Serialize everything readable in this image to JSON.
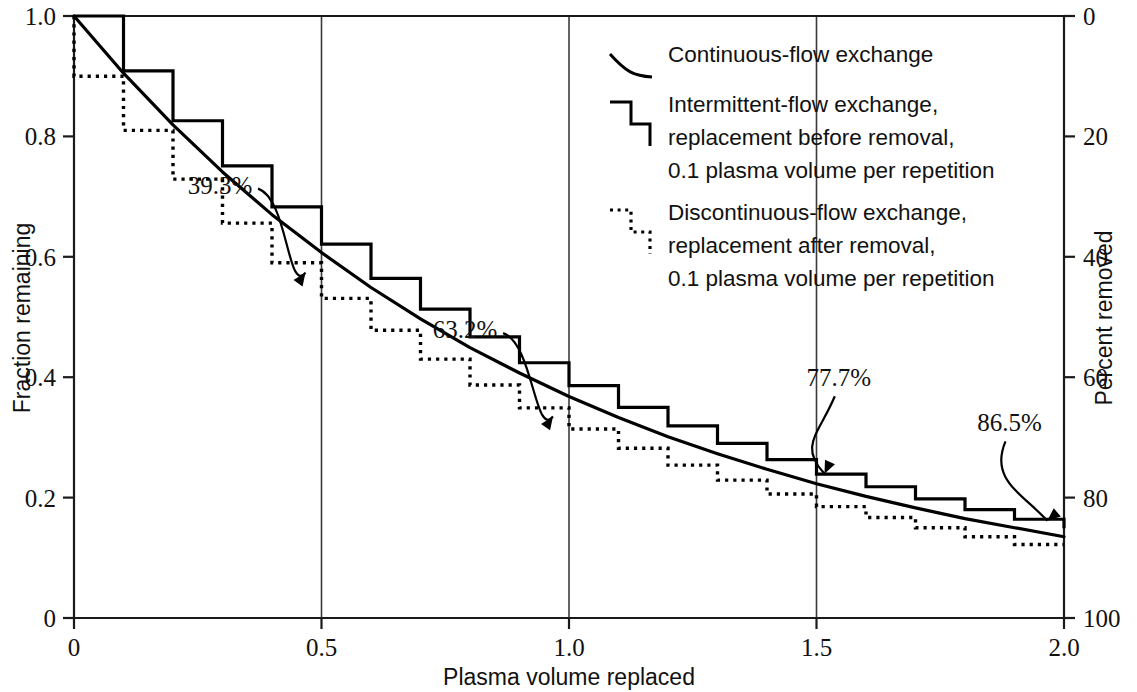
{
  "chart_data": {
    "type": "line",
    "title": "",
    "xlabel": "Plasma volume replaced",
    "ylabel": "Fraction remaining",
    "y2label": "Percent removed",
    "xlim": [
      0,
      2.0
    ],
    "ylim": [
      0,
      1.0
    ],
    "y2lim": [
      100,
      0
    ],
    "grid": "vertical-only",
    "legend_position": "top-right",
    "x_ticks": [
      "0",
      "0.5",
      "1.0",
      "1.5",
      "2.0"
    ],
    "x_tick_values": [
      0,
      0.5,
      1.0,
      1.5,
      2.0
    ],
    "y_ticks": [
      "0",
      "0.2",
      "0.4",
      "0.6",
      "0.8",
      "1.0"
    ],
    "y_tick_values": [
      0,
      0.2,
      0.4,
      0.6,
      0.8,
      1.0
    ],
    "y2_ticks": [
      "0",
      "20",
      "40",
      "60",
      "80",
      "100"
    ],
    "y2_tick_values": [
      0,
      20,
      40,
      60,
      80,
      100
    ],
    "series": [
      {
        "name": "Continuous-flow exchange",
        "style": "solid-smooth",
        "formula": "y = exp(-x)",
        "x": [
          0,
          0.1,
          0.2,
          0.3,
          0.4,
          0.5,
          0.6,
          0.7,
          0.8,
          0.9,
          1.0,
          1.1,
          1.2,
          1.3,
          1.4,
          1.5,
          1.6,
          1.7,
          1.8,
          1.9,
          2.0
        ],
        "values": [
          1.0,
          0.905,
          0.819,
          0.741,
          0.67,
          0.607,
          0.549,
          0.497,
          0.449,
          0.407,
          0.368,
          0.333,
          0.301,
          0.273,
          0.247,
          0.223,
          0.202,
          0.183,
          0.165,
          0.15,
          0.135
        ]
      },
      {
        "name": "Intermittent-flow exchange, replacement before removal, 0.1 plasma volume per repetition",
        "style": "solid-step",
        "formula": "y = (1/1.1)^n",
        "x": [
          0,
          0.1,
          0.2,
          0.3,
          0.4,
          0.5,
          0.6,
          0.7,
          0.8,
          0.9,
          1.0,
          1.1,
          1.2,
          1.3,
          1.4,
          1.5,
          1.6,
          1.7,
          1.8,
          1.9,
          2.0
        ],
        "values": [
          1.0,
          0.909,
          0.826,
          0.751,
          0.683,
          0.621,
          0.564,
          0.513,
          0.467,
          0.424,
          0.386,
          0.35,
          0.319,
          0.29,
          0.263,
          0.239,
          0.218,
          0.198,
          0.18,
          0.164,
          0.149
        ]
      },
      {
        "name": "Discontinuous-flow exchange, replacement after removal, 0.1 plasma volume per repetition",
        "style": "dotted-step",
        "formula": "y = 0.9^n",
        "x": [
          0,
          0.1,
          0.2,
          0.3,
          0.4,
          0.5,
          0.6,
          0.7,
          0.8,
          0.9,
          1.0,
          1.1,
          1.2,
          1.3,
          1.4,
          1.5,
          1.6,
          1.7,
          1.8,
          1.9,
          2.0
        ],
        "values": [
          1.0,
          0.9,
          0.81,
          0.729,
          0.656,
          0.59,
          0.531,
          0.478,
          0.43,
          0.387,
          0.349,
          0.314,
          0.282,
          0.254,
          0.229,
          0.206,
          0.185,
          0.167,
          0.15,
          0.135,
          0.122
        ]
      }
    ],
    "annotations": [
      {
        "text": "39.3%",
        "x": 0.5,
        "y": 0.607,
        "label_x": 0.295,
        "label_y": 0.705
      },
      {
        "text": "63.2%",
        "x": 1.0,
        "y": 0.368,
        "label_x": 0.79,
        "label_y": 0.465
      },
      {
        "text": "77.7%",
        "x": 1.5,
        "y": 0.223,
        "label_x": 1.545,
        "label_y": 0.385
      },
      {
        "text": "86.5%",
        "x": 1.95,
        "y": 0.145,
        "label_x": 1.89,
        "label_y": 0.31
      }
    ]
  },
  "axes": {
    "left": {
      "title": "Fraction remaining",
      "ticks": [
        "1.0",
        "0.8",
        "0.6",
        "0.4",
        "0.2",
        "0"
      ]
    },
    "right": {
      "title": "Percent removed",
      "ticks": [
        "0",
        "20",
        "40",
        "60",
        "80",
        "100"
      ]
    },
    "bottom": {
      "title": "Plasma volume replaced",
      "ticks": [
        "0",
        "0.5",
        "1.0",
        "1.5",
        "2.0"
      ]
    }
  },
  "legend": {
    "entries": [
      {
        "icon": "smooth-decay-curve-icon",
        "lines": [
          "Continuous-flow exchange"
        ]
      },
      {
        "icon": "solid-step-icon",
        "lines": [
          "Intermittent-flow exchange,",
          "replacement before removal,",
          "0.1 plasma volume per repetition"
        ]
      },
      {
        "icon": "dotted-step-icon",
        "lines": [
          "Discontinuous-flow exchange,",
          "replacement after removal,",
          "0.1 plasma volume per repetition"
        ]
      }
    ]
  },
  "annotation_labels": [
    "39.3%",
    "63.2%",
    "77.7%",
    "86.5%"
  ],
  "colors": {
    "ink": "#000000",
    "axis": "#1a1a1a",
    "grid": "#3b3b3b",
    "background": "#ffffff"
  }
}
